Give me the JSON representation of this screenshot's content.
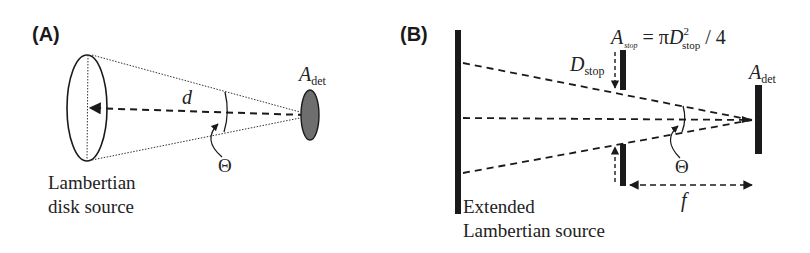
{
  "panels": {
    "A": {
      "label": "(A)",
      "distance_label": "d",
      "angle_label": "Θ",
      "detector_label_main": "A",
      "detector_label_sub": "det",
      "source_label_line1": "Lambertian",
      "source_label_line2": "disk source"
    },
    "B": {
      "label": "(B)",
      "stop_area_main": "A",
      "stop_area_sub": "stop",
      "equation_eq": "= π",
      "equation_D": "D",
      "equation_sup": "2",
      "equation_sub": "stop",
      "equation_tail": "/ 4",
      "stop_diameter_main": "D",
      "stop_diameter_sub": "stop",
      "detector_label_main": "A",
      "detector_label_sub": "det",
      "angle_label": "Θ",
      "focal_label": "f",
      "source_label_line1": "Extended",
      "source_label_line2": "Lambertian source"
    }
  },
  "colors": {
    "ink": "#1a1a1a",
    "detector_fill": "#6e6e6e",
    "background": "#ffffff"
  }
}
